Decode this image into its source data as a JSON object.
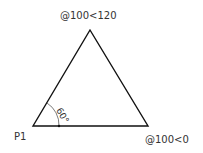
{
  "diagram": {
    "type": "triangle",
    "labels": {
      "apex": "@100<120",
      "start": "P1",
      "end": "@100<0",
      "angle": "60°"
    },
    "colors": {
      "stroke": "#111111",
      "text": "#333333"
    }
  }
}
